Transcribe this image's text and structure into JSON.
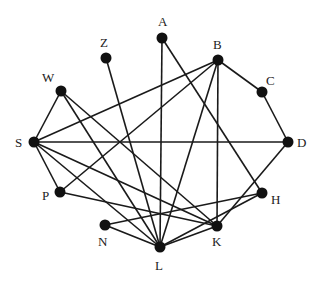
{
  "diagram": {
    "type": "undirected-graph",
    "nodes": [
      {
        "id": "A",
        "x": 162,
        "y": 38,
        "lx": 158,
        "ly": 26
      },
      {
        "id": "Z",
        "x": 106,
        "y": 58,
        "lx": 100,
        "ly": 47
      },
      {
        "id": "B",
        "x": 218,
        "y": 60,
        "lx": 213,
        "ly": 49
      },
      {
        "id": "W",
        "x": 61,
        "y": 91,
        "lx": 42,
        "ly": 82
      },
      {
        "id": "C",
        "x": 262,
        "y": 92,
        "lx": 266,
        "ly": 85
      },
      {
        "id": "S",
        "x": 34,
        "y": 142,
        "lx": 15,
        "ly": 147
      },
      {
        "id": "D",
        "x": 288,
        "y": 142,
        "lx": 297,
        "ly": 147
      },
      {
        "id": "P",
        "x": 60,
        "y": 192,
        "lx": 42,
        "ly": 200
      },
      {
        "id": "H",
        "x": 262,
        "y": 193,
        "lx": 271,
        "ly": 204
      },
      {
        "id": "N",
        "x": 105,
        "y": 225,
        "lx": 98,
        "ly": 246
      },
      {
        "id": "K",
        "x": 217,
        "y": 226,
        "lx": 212,
        "ly": 246
      },
      {
        "id": "L",
        "x": 160,
        "y": 247,
        "lx": 155,
        "ly": 270
      }
    ],
    "edges": [
      [
        "S",
        "W"
      ],
      [
        "S",
        "B"
      ],
      [
        "S",
        "D"
      ],
      [
        "S",
        "P"
      ],
      [
        "S",
        "K"
      ],
      [
        "S",
        "L"
      ],
      [
        "W",
        "L"
      ],
      [
        "W",
        "K"
      ],
      [
        "Z",
        "L"
      ],
      [
        "A",
        "L"
      ],
      [
        "A",
        "H"
      ],
      [
        "B",
        "C"
      ],
      [
        "B",
        "P"
      ],
      [
        "B",
        "L"
      ],
      [
        "B",
        "K"
      ],
      [
        "C",
        "D"
      ],
      [
        "D",
        "K"
      ],
      [
        "P",
        "K"
      ],
      [
        "N",
        "H"
      ],
      [
        "N",
        "L"
      ],
      [
        "H",
        "L"
      ],
      [
        "K",
        "L"
      ]
    ],
    "colors": {
      "node": "#111111",
      "edge": "#1a1a1a",
      "label": "#222222",
      "background": "#ffffff"
    }
  }
}
